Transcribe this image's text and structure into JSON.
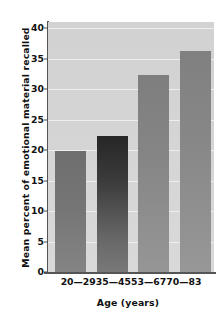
{
  "chart_data": {
    "type": "bar",
    "title": "",
    "xlabel": "Age (years)",
    "ylabel": "Mean percent of emotional material recalled",
    "categories": [
      "20—29",
      "35—45",
      "53—67",
      "70—83"
    ],
    "values": [
      19.9,
      22.3,
      32.3,
      36.3
    ],
    "ylim": [
      0,
      41
    ],
    "yticks": [
      0,
      5,
      10,
      15,
      20,
      25,
      30,
      35,
      40
    ],
    "ytick_labels": [
      "0",
      "5",
      "10",
      "15",
      "20",
      "25",
      "30",
      "35",
      "40"
    ],
    "grid": true,
    "grid_axis": "y",
    "legend": "none",
    "bar_colors": [
      "#757575",
      "#3d3d3d",
      "#858585",
      "#878787"
    ],
    "plot_background": "#d4d4d4",
    "gridline_color": "#eeeeee",
    "axis_color": "#555555",
    "text_color": "#111111"
  }
}
